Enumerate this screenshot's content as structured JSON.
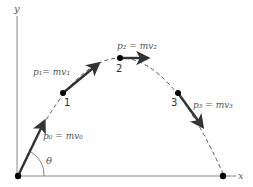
{
  "diagram": {
    "type": "projectile-momentum",
    "axes": {
      "x_label": "x",
      "y_label": "y",
      "color": "#777777"
    },
    "trajectory": {
      "style": "dashed",
      "color": "#555555"
    },
    "angle_label": "θ",
    "points": [
      {
        "id": "0",
        "marker_label": "",
        "vector_label": "p₀ = mv₀"
      },
      {
        "id": "1",
        "marker_label": "1",
        "vector_label": "p₁= mv₁"
      },
      {
        "id": "2",
        "marker_label": "2",
        "vector_label": "p₂ = mv₂"
      },
      {
        "id": "3",
        "marker_label": "3",
        "vector_label": "p₃ = mv₃"
      },
      {
        "id": "end",
        "marker_label": "",
        "vector_label": ""
      }
    ],
    "colors": {
      "vector": "#333333",
      "point": "#000000",
      "label": "#555555"
    }
  }
}
